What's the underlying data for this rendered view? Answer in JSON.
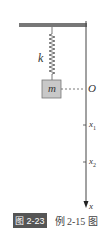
{
  "figure": {
    "labels": {
      "spring_constant": "k",
      "mass": "m",
      "origin": "O",
      "x1": "x",
      "x1_sub": "1",
      "x2": "x",
      "x2_sub": "2",
      "axis": "x"
    },
    "caption": {
      "number": "图 2-23",
      "text": "例 2-15 图"
    },
    "colors": {
      "ceiling": "#777777",
      "mass_fill": "#c8c8c8",
      "line": "#444444"
    }
  }
}
